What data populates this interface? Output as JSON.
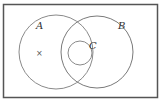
{
  "diagram": {
    "type": "venn",
    "frame": {
      "x": 3,
      "y": 4,
      "width": 155,
      "height": 94,
      "stroke": "#555555"
    },
    "sets": [
      {
        "label": "A",
        "cx": 56,
        "cy": 52,
        "r": 37,
        "label_x": 37,
        "label_y": 29
      },
      {
        "label": "B",
        "cx": 97,
        "cy": 52,
        "r": 36,
        "label_x": 119,
        "label_y": 29
      },
      {
        "label": "C",
        "cx": 80,
        "cy": 53,
        "r": 12,
        "label_x": 90,
        "label_y": 48
      }
    ],
    "marker": {
      "symbol": "×",
      "x": 39,
      "y": 56
    },
    "stroke_color": "#8a8a8a"
  }
}
